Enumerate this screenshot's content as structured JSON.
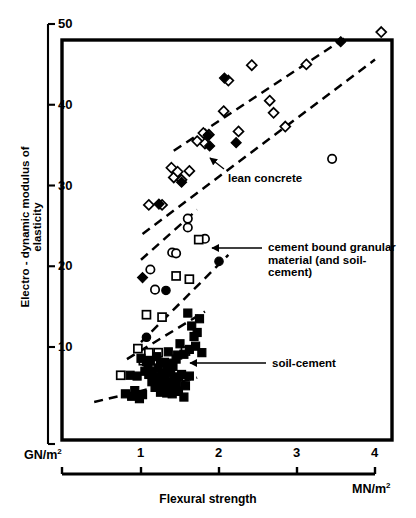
{
  "chart_data": {
    "type": "scatter",
    "title": "",
    "xlabel": "Flexural strength",
    "ylabel": "Electro - dynamic modulus of elasticity",
    "x_unit": "MN/m2",
    "y_unit": "GN/m2",
    "xlim": [
      0.1,
      4.0
    ],
    "ylim": [
      2.5,
      48.0
    ],
    "xticks": [
      1,
      2,
      3,
      4
    ],
    "xtick_labels": [
      "1",
      "2",
      "3",
      "4"
    ],
    "yticks": [
      10,
      20,
      30,
      40,
      50
    ],
    "ytick_labels": [
      "10",
      "20",
      "30",
      "40",
      "50"
    ],
    "grid": false,
    "legend_position": "inline-annotations",
    "series": [
      {
        "name": "lean concrete",
        "marker": "diamond-open",
        "fill": "#ffffff",
        "stroke": "#000000",
        "points": [
          [
            1.1,
            27.6
          ],
          [
            1.27,
            27.6
          ],
          [
            1.39,
            32.2
          ],
          [
            1.42,
            31.0
          ],
          [
            1.47,
            31.7
          ],
          [
            1.52,
            30.7
          ],
          [
            1.62,
            31.8
          ],
          [
            1.72,
            35.5
          ],
          [
            1.8,
            36.5
          ],
          [
            1.82,
            35.2
          ],
          [
            1.87,
            36.3
          ],
          [
            2.06,
            39.2
          ],
          [
            2.12,
            43.0
          ],
          [
            2.25,
            36.7
          ],
          [
            2.42,
            44.9
          ],
          [
            2.65,
            40.5
          ],
          [
            2.7,
            39.0
          ],
          [
            2.85,
            37.3
          ],
          [
            3.12,
            45.0
          ],
          [
            4.08,
            49.0
          ]
        ]
      },
      {
        "name": "lean concrete (filled)",
        "marker": "diamond-filled",
        "fill": "#000000",
        "stroke": "#000000",
        "points": [
          [
            1.23,
            27.7
          ],
          [
            1.52,
            30.4
          ],
          [
            1.86,
            36.2
          ],
          [
            1.88,
            34.9
          ],
          [
            2.07,
            43.3
          ],
          [
            2.22,
            35.3
          ],
          [
            3.56,
            47.8
          ],
          [
            1.02,
            18.6
          ]
        ]
      },
      {
        "name": "cement bound granular material (and soil-cement)",
        "marker": "circle-open",
        "fill": "#ffffff",
        "stroke": "#000000",
        "points": [
          [
            1.12,
            19.6
          ],
          [
            1.18,
            17.1
          ],
          [
            1.4,
            21.7
          ],
          [
            1.45,
            21.6
          ],
          [
            1.6,
            25.9
          ],
          [
            1.6,
            24.8
          ],
          [
            1.82,
            23.4
          ],
          [
            3.45,
            33.3
          ]
        ]
      },
      {
        "name": "cement bound granular material (filled circles)",
        "marker": "circle-filled",
        "fill": "#000000",
        "stroke": "#000000",
        "points": [
          [
            1.07,
            11.2
          ],
          [
            1.32,
            17.0
          ],
          [
            2.0,
            20.6
          ]
        ]
      },
      {
        "name": "cement bound granular material (open squares)",
        "marker": "square-open",
        "fill": "#ffffff",
        "stroke": "#000000",
        "points": [
          [
            0.96,
            9.8
          ],
          [
            1.07,
            14.0
          ],
          [
            1.27,
            13.7
          ],
          [
            1.45,
            18.8
          ],
          [
            1.62,
            18.4
          ],
          [
            1.74,
            23.3
          ],
          [
            0.74,
            6.5
          ],
          [
            1.03,
            8.3
          ],
          [
            1.1,
            9.3
          ],
          [
            1.22,
            9.3
          ],
          [
            1.2,
            8.3
          ],
          [
            1.57,
            9.5
          ]
        ]
      },
      {
        "name": "soil-cement",
        "marker": "square-filled",
        "fill": "#000000",
        "stroke": "#000000",
        "points": [
          [
            0.86,
            6.5
          ],
          [
            0.95,
            6.4
          ],
          [
            1.0,
            8.6
          ],
          [
            1.05,
            7.0
          ],
          [
            1.07,
            8.2
          ],
          [
            1.09,
            7.8
          ],
          [
            1.1,
            6.6
          ],
          [
            1.12,
            8.3
          ],
          [
            1.14,
            5.7
          ],
          [
            1.15,
            7.0
          ],
          [
            1.16,
            6.2
          ],
          [
            1.18,
            5.0
          ],
          [
            1.2,
            8.8
          ],
          [
            1.21,
            6.1
          ],
          [
            1.22,
            7.4
          ],
          [
            1.23,
            5.4
          ],
          [
            1.25,
            4.4
          ],
          [
            1.26,
            6.8
          ],
          [
            1.27,
            5.9
          ],
          [
            1.28,
            4.8
          ],
          [
            1.3,
            8.1
          ],
          [
            1.31,
            6.4
          ],
          [
            1.32,
            5.2
          ],
          [
            1.33,
            4.3
          ],
          [
            1.34,
            7.2
          ],
          [
            1.35,
            5.6
          ],
          [
            1.36,
            4.6
          ],
          [
            1.38,
            6.9
          ],
          [
            1.39,
            5.1
          ],
          [
            1.4,
            4.2
          ],
          [
            1.41,
            7.6
          ],
          [
            1.42,
            6.0
          ],
          [
            1.43,
            4.9
          ],
          [
            1.45,
            8.5
          ],
          [
            1.46,
            5.5
          ],
          [
            1.48,
            4.5
          ],
          [
            1.5,
            10.4
          ],
          [
            1.52,
            6.6
          ],
          [
            1.55,
            9.1
          ],
          [
            1.57,
            5.2
          ],
          [
            1.6,
            14.2
          ],
          [
            1.62,
            9.7
          ],
          [
            1.65,
            12.6
          ],
          [
            1.68,
            11.3
          ],
          [
            1.7,
            10.1
          ],
          [
            1.72,
            11.8
          ],
          [
            1.75,
            13.5
          ],
          [
            1.78,
            9.3
          ],
          [
            0.8,
            4.2
          ],
          [
            0.88,
            3.9
          ],
          [
            0.92,
            4.6
          ],
          [
            0.98,
            3.6
          ],
          [
            1.02,
            4.1
          ],
          [
            1.48,
            6.3
          ],
          [
            1.55,
            3.8
          ],
          [
            1.62,
            6.4
          ],
          [
            1.47,
            9.0
          ],
          [
            1.35,
            9.4
          ],
          [
            1.4,
            8.0
          ],
          [
            1.25,
            8.0
          ]
        ]
      }
    ],
    "envelope_lines": [
      {
        "name": "lean-concrete-upper",
        "x1": 1.42,
        "y1": 34.3,
        "x2": 3.62,
        "y2": 48.3
      },
      {
        "name": "lean-concrete-lower",
        "x1": 1.02,
        "y1": 24.0,
        "x2": 4.0,
        "y2": 45.6
      },
      {
        "name": "cbgm-upper",
        "x1": 1.0,
        "y1": 20.8,
        "x2": 1.72,
        "y2": 27.0
      },
      {
        "name": "cbgm-lower",
        "x1": 1.0,
        "y1": 10.6,
        "x2": 2.12,
        "y2": 21.4
      },
      {
        "name": "soil-cement-upper",
        "x1": 0.82,
        "y1": 8.5,
        "x2": 1.82,
        "y2": 14.4
      },
      {
        "name": "soil-cement-lower",
        "x1": 0.4,
        "y1": 3.2,
        "x2": 1.72,
        "y2": 6.2
      }
    ],
    "annotations": [
      {
        "name": "lean-concrete",
        "text": "lean concrete",
        "text_x": 228,
        "text_y": 172,
        "leader": [
          [
            224,
            169
          ],
          [
            210,
            158
          ]
        ],
        "arrow_at": [
          210,
          158
        ]
      },
      {
        "name": "cement-bound-granular",
        "text_lines": [
          "cement bound granular",
          "material (and soil-",
          "cement)"
        ],
        "text_x": 268,
        "text_y": 241,
        "leader": [
          [
            262,
            248
          ],
          [
            212,
            248
          ]
        ],
        "arrow_at": [
          212,
          248
        ]
      },
      {
        "name": "soil-cement",
        "text": "soil-cement",
        "text_x": 272,
        "text_y": 357,
        "leader": [
          [
            266,
            363
          ],
          [
            190,
            363
          ]
        ],
        "arrow_at": [
          190,
          363
        ]
      }
    ]
  },
  "axes": {
    "y_unit_label": "GN/m2",
    "x_unit_label": "MN/m2",
    "x_title": "Flexural strength",
    "y_title": "Electro - dynamic modulus of elasticity"
  }
}
